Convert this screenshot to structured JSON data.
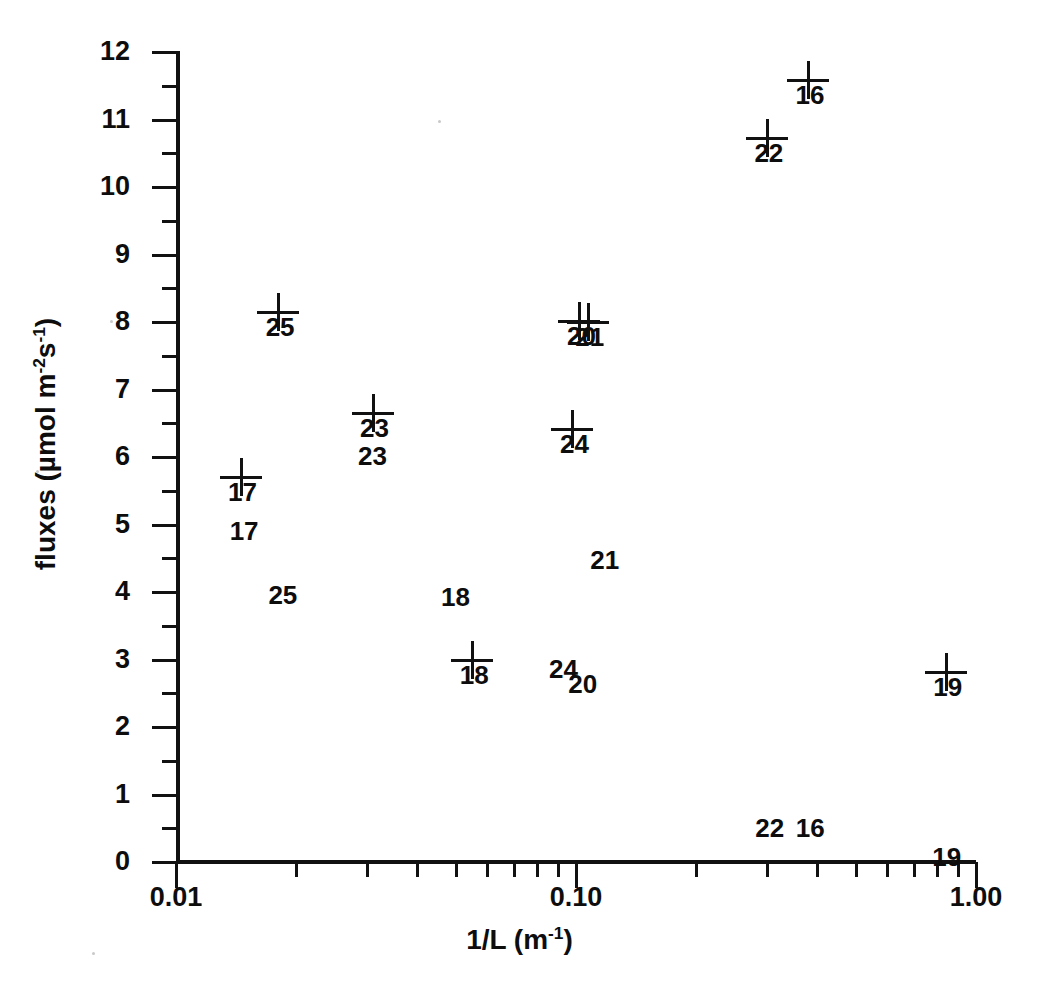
{
  "chart_data": {
    "type": "scatter",
    "title": "",
    "xlabel": "1/L (m-1)",
    "xlabel_html": "1/L (m<sup>-1</sup>)",
    "ylabel": "fluxes (umol m-2s-1)",
    "ylabel_html": "fluxes (&#181;mol  m<sup>-2</sup>s<sup>-1</sup>)",
    "xscale": "log",
    "yscale": "linear",
    "xlim": [
      0.01,
      1.0
    ],
    "ylim": [
      0,
      12
    ],
    "grid": false,
    "legend": "none",
    "marker": "plus-cross",
    "x_tick_labels": [
      "0.01",
      "0.10",
      "1.00"
    ],
    "x_tick_values": [
      0.01,
      0.1,
      1.0
    ],
    "y_tick_labels": [
      "0",
      "1",
      "2",
      "3",
      "4",
      "5",
      "6",
      "7",
      "8",
      "9",
      "10",
      "11",
      "12"
    ],
    "y_tick_values": [
      0,
      1,
      2,
      3,
      4,
      5,
      6,
      7,
      8,
      9,
      10,
      11,
      12
    ],
    "y_minor_tick_values": [
      0.5,
      1.5,
      2.5,
      3.5,
      4.5,
      5.5,
      6.5,
      7.5,
      8.5,
      9.5,
      10.5,
      11.5
    ],
    "points": [
      {
        "label": "16",
        "x": 0.38,
        "y": 11.58,
        "marker": "cross"
      },
      {
        "label": "22",
        "x": 0.3,
        "y": 10.72,
        "marker": "cross"
      },
      {
        "label": "25",
        "x": 0.018,
        "y": 8.15,
        "marker": "cross"
      },
      {
        "label": "20",
        "x": 0.102,
        "y": 8.02,
        "marker": "cross"
      },
      {
        "label": "21",
        "x": 0.107,
        "y": 8.0,
        "marker": "cross"
      },
      {
        "label": "23",
        "x": 0.031,
        "y": 6.65,
        "marker": "cross"
      },
      {
        "label": "24",
        "x": 0.098,
        "y": 6.42,
        "marker": "cross"
      },
      {
        "label": "17",
        "x": 0.0145,
        "y": 5.7,
        "marker": "cross"
      },
      {
        "label": "18",
        "x": 0.055,
        "y": 3.0,
        "marker": "cross"
      },
      {
        "label": "19",
        "x": 0.84,
        "y": 2.82,
        "marker": "cross"
      }
    ],
    "text_labels": [
      {
        "label": "23",
        "x": 0.031,
        "y": 6.02
      },
      {
        "label": "17",
        "x": 0.0148,
        "y": 4.9
      },
      {
        "label": "21",
        "x": 0.118,
        "y": 4.47
      },
      {
        "label": "25",
        "x": 0.0185,
        "y": 3.96
      },
      {
        "label": "18",
        "x": 0.05,
        "y": 3.93
      },
      {
        "label": "24",
        "x": 0.093,
        "y": 2.86
      },
      {
        "label": "20",
        "x": 0.104,
        "y": 2.63
      },
      {
        "label": "22",
        "x": 0.305,
        "y": 0.5
      },
      {
        "label": "16",
        "x": 0.385,
        "y": 0.5
      },
      {
        "label": "19",
        "x": 0.845,
        "y": 0.07
      }
    ],
    "colors": {
      "ink": "#111111",
      "background": "#ffffff"
    }
  }
}
